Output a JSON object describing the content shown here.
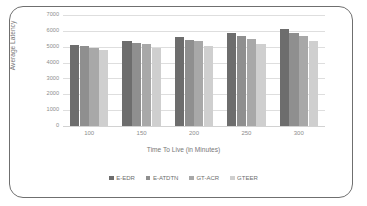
{
  "chart_data": {
    "type": "bar",
    "title": "",
    "xlabel": "Time To Live (in Minutes)",
    "ylabel": "Average Latency",
    "categories": [
      "100",
      "150",
      "200",
      "250",
      "300"
    ],
    "ylim": [
      0,
      7000
    ],
    "yticks": [
      "0",
      "1000",
      "2000",
      "3000",
      "4000",
      "5000",
      "6000",
      "7000"
    ],
    "ytick_values": [
      0,
      1000,
      2000,
      3000,
      4000,
      5000,
      6000,
      7000
    ],
    "grid": true,
    "legend_position": "bottom",
    "series": [
      {
        "name": "E-EDR",
        "color": "#6d6d6d",
        "values": [
          5100,
          5350,
          5600,
          5850,
          6100
        ]
      },
      {
        "name": "E-ATDTN",
        "color": "#8f8f8f",
        "values": [
          5050,
          5250,
          5450,
          5650,
          5850
        ]
      },
      {
        "name": "GT-ACR",
        "color": "#a8a8a8",
        "values": [
          4950,
          5150,
          5350,
          5500,
          5700
        ]
      },
      {
        "name": "GTEER",
        "color": "#cfcfcf",
        "values": [
          4800,
          4950,
          5050,
          5200,
          5350
        ]
      }
    ]
  },
  "legend": {
    "items": [
      {
        "label": "E-EDR",
        "color": "#6d6d6d"
      },
      {
        "label": "E-ATDTN",
        "color": "#8f8f8f"
      },
      {
        "label": "GT-ACR",
        "color": "#a8a8a8"
      },
      {
        "label": "GTEER",
        "color": "#cfcfcf"
      }
    ]
  },
  "colors": {
    "border": "#6f6f6f",
    "grid": "#dedede",
    "tick_text": "#8d8d8d",
    "axis_title": "#787878",
    "background": "#ffffff"
  }
}
